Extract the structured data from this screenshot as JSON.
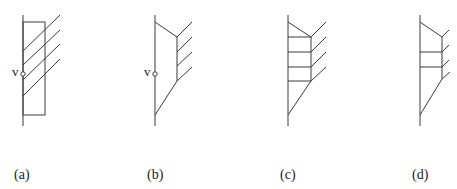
{
  "figure": {
    "panels": [
      {
        "id": "a",
        "label": "(a)",
        "point_label": "v"
      },
      {
        "id": "b",
        "label": "(b)",
        "point_label": "v"
      },
      {
        "id": "c",
        "label": "(c)"
      },
      {
        "id": "d",
        "label": "(d)"
      }
    ],
    "colors": {
      "line": "#3a3a3a",
      "background": "#ffffff"
    }
  }
}
